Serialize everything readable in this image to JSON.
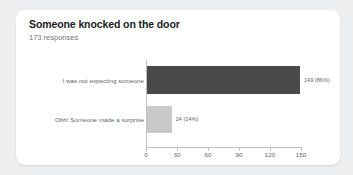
{
  "card": {
    "title": "Someone knocked on the door",
    "response_count": "173 responses",
    "background_color": "#ffffff",
    "page_background_color": "#eceeef"
  },
  "chart_data": {
    "type": "bar",
    "orientation": "horizontal",
    "title": "Someone knocked on the door",
    "subtitle": "173 responses",
    "categories": [
      "I was not expecting someone",
      "Ohh! Someone made a surprise"
    ],
    "values": [
      149,
      24
    ],
    "percentages": [
      "86%",
      "14%"
    ],
    "data_labels": [
      "149 (86%)",
      "24 (14%)"
    ],
    "bar_colors": [
      "#4a4a4a",
      "#c9c9c9"
    ],
    "xlabel": "",
    "ylabel": "",
    "xlim": [
      0,
      150
    ],
    "xticks": [
      0,
      30,
      60,
      90,
      120,
      150
    ],
    "xtick_labels": [
      "0",
      "30",
      "60",
      "90",
      "120",
      "150"
    ],
    "grid": false,
    "legend": false,
    "total_responses": 173
  }
}
